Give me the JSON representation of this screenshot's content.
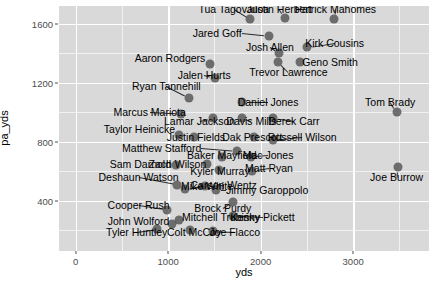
{
  "chart_data": {
    "type": "scatter",
    "title": "",
    "xlabel": "yds",
    "ylabel": "pa_yds",
    "xlim": [
      -180,
      3820
    ],
    "ylim": [
      60,
      1720
    ],
    "xticks": [
      0,
      1000,
      2000,
      3000
    ],
    "yticks": [
      400,
      800,
      1200,
      1600
    ],
    "xtick_labels": [
      "0",
      "1000",
      "2000",
      "3000"
    ],
    "ytick_labels": [
      "400",
      "800",
      "1200",
      "1600"
    ],
    "grid": true,
    "legend": "none",
    "point_color": "#4d4d4d",
    "panel_color": "#d9d9d9",
    "gridline_color": "#ffffff",
    "points": [
      {
        "label": "Tua Tagovailoa",
        "x": 1890,
        "y": 1630,
        "lx": 1710,
        "ly": 1700
      },
      {
        "label": "Justin Herbert",
        "x": 2260,
        "y": 1640,
        "lx": 2200,
        "ly": 1700
      },
      {
        "label": "Patrick Mahomes",
        "x": 2790,
        "y": 1630,
        "lx": 2810,
        "ly": 1700
      },
      {
        "label": "Jared Goff",
        "x": 2090,
        "y": 1520,
        "lx": 1530,
        "ly": 1540
      },
      {
        "label": "Josh Allen",
        "x": 2200,
        "y": 1400,
        "lx": 2100,
        "ly": 1440
      },
      {
        "label": "Kirk Cousins",
        "x": 2500,
        "y": 1440,
        "lx": 2800,
        "ly": 1470
      },
      {
        "label": "Aaron Rodgers",
        "x": 1450,
        "y": 1330,
        "lx": 1020,
        "ly": 1370
      },
      {
        "label": "Geno Smith",
        "x": 2420,
        "y": 1340,
        "lx": 2750,
        "ly": 1340
      },
      {
        "label": "Trevor Lawrence",
        "x": 2190,
        "y": 1340,
        "lx": 2300,
        "ly": 1270
      },
      {
        "label": "Jalen Hurts",
        "x": 1510,
        "y": 1230,
        "lx": 1390,
        "ly": 1250
      },
      {
        "label": "Ryan Tannehill",
        "x": 1230,
        "y": 1100,
        "lx": 980,
        "ly": 1180
      },
      {
        "label": "Daniel Jones",
        "x": 1800,
        "y": 1070,
        "lx": 2080,
        "ly": 1070
      },
      {
        "label": "Tom Brady",
        "x": 3470,
        "y": 1000,
        "lx": 3400,
        "ly": 1070
      },
      {
        "label": "Marcus Mariota",
        "x": 1140,
        "y": 990,
        "lx": 800,
        "ly": 1000
      },
      {
        "label": "Lamar Jackson",
        "x": 1480,
        "y": 960,
        "lx": 1340,
        "ly": 940
      },
      {
        "label": "Davis Mills",
        "x": 1800,
        "y": 960,
        "lx": 1900,
        "ly": 940
      },
      {
        "label": "Derek Carr",
        "x": 2130,
        "y": 960,
        "lx": 2360,
        "ly": 940
      },
      {
        "label": "Taylor Heinicke",
        "x": 1120,
        "y": 845,
        "lx": 690,
        "ly": 890
      },
      {
        "label": "Justin Fields",
        "x": 1280,
        "y": 830,
        "lx": 1300,
        "ly": 830
      },
      {
        "label": "Dak Prescott",
        "x": 1930,
        "y": 830,
        "lx": 1910,
        "ly": 830
      },
      {
        "label": "Russell Wilson",
        "x": 2130,
        "y": 810,
        "lx": 2450,
        "ly": 830
      },
      {
        "label": "Matthew Stafford",
        "x": 1740,
        "y": 740,
        "lx": 930,
        "ly": 760
      },
      {
        "label": "Baker Mayfield",
        "x": 1580,
        "y": 700,
        "lx": 1580,
        "ly": 710
      },
      {
        "label": "Mac Jones",
        "x": 1900,
        "y": 700,
        "lx": 2080,
        "ly": 710
      },
      {
        "label": "Sam Darnold",
        "x": 1080,
        "y": 640,
        "lx": 700,
        "ly": 650
      },
      {
        "label": "Zach Wilson",
        "x": 1420,
        "y": 650,
        "lx": 1100,
        "ly": 650
      },
      {
        "label": "Kyler Murray",
        "x": 1550,
        "y": 610,
        "lx": 1560,
        "ly": 600
      },
      {
        "label": "Matt Ryan",
        "x": 1910,
        "y": 600,
        "lx": 2090,
        "ly": 620
      },
      {
        "label": "Deshaun Watson",
        "x": 1100,
        "y": 510,
        "lx": 680,
        "ly": 560
      },
      {
        "label": "Mike White",
        "x": 1180,
        "y": 480,
        "lx": 1420,
        "ly": 500
      },
      {
        "label": "Carson Wentz",
        "x": 1400,
        "y": 500,
        "lx": 1600,
        "ly": 510
      },
      {
        "label": "Jimmy Garoppolo",
        "x": 1520,
        "y": 470,
        "lx": 2070,
        "ly": 470
      },
      {
        "label": "Brock Purdy",
        "x": 1700,
        "y": 395,
        "lx": 1590,
        "ly": 350
      },
      {
        "label": "Cooper Rush",
        "x": 990,
        "y": 340,
        "lx": 680,
        "ly": 370
      },
      {
        "label": "Mitchell Trubisky",
        "x": 1120,
        "y": 270,
        "lx": 1570,
        "ly": 290
      },
      {
        "label": "Kenny Pickett",
        "x": 1700,
        "y": 300,
        "lx": 2020,
        "ly": 290
      },
      {
        "label": "John Wolford",
        "x": 1040,
        "y": 245,
        "lx": 680,
        "ly": 260
      },
      {
        "label": "Tyler Huntley",
        "x": 880,
        "y": 210,
        "lx": 660,
        "ly": 190
      },
      {
        "label": "Colt McCoy",
        "x": 1240,
        "y": 200,
        "lx": 1280,
        "ly": 190
      },
      {
        "label": "Joe Flacco",
        "x": 1480,
        "y": 195,
        "lx": 1720,
        "ly": 190
      },
      {
        "label": "Joe Burrow",
        "x": 3480,
        "y": 630,
        "lx": 3470,
        "ly": 560
      }
    ]
  }
}
